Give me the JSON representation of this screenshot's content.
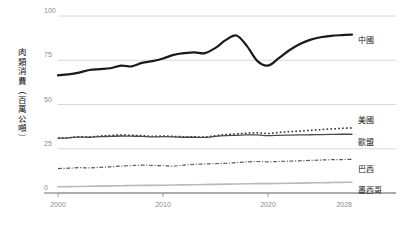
{
  "chart_data": {
    "type": "line",
    "title": "",
    "xlabel": "",
    "ylabel": "肉類消費（百萬公噸）",
    "xlim": [
      2000,
      2028
    ],
    "ylim": [
      0,
      100
    ],
    "yticks": [
      0,
      25,
      50,
      75,
      100
    ],
    "ytick_labels": [
      "0",
      "25",
      "50",
      "75",
      "100"
    ],
    "xticks": [
      2000,
      2010,
      2020,
      2028
    ],
    "xtick_labels": [
      "2000",
      "2010",
      "2020",
      "2028"
    ],
    "grid": true,
    "legend_position": "right-inline",
    "x": [
      2000,
      2001,
      2002,
      2003,
      2004,
      2005,
      2006,
      2007,
      2008,
      2009,
      2010,
      2011,
      2012,
      2013,
      2014,
      2015,
      2016,
      2017,
      2018,
      2019,
      2020,
      2021,
      2022,
      2023,
      2024,
      2025,
      2026,
      2027,
      2028
    ],
    "series": [
      {
        "name": "中國",
        "label": "中國",
        "color": "#1a1a1a",
        "style": "solid",
        "width": 2.2,
        "values": [
          66.5,
          67.0,
          68.0,
          69.5,
          70.0,
          70.5,
          72.0,
          71.5,
          73.5,
          74.5,
          76.0,
          78.0,
          79.0,
          79.5,
          79.0,
          82.0,
          86.5,
          89.0,
          83.0,
          74.5,
          72.0,
          76.0,
          80.5,
          84.0,
          86.5,
          88.0,
          88.8,
          89.2,
          89.5
        ]
      },
      {
        "name": "美國",
        "label": "美國",
        "color": "#2b2b2b",
        "style": "dotted",
        "width": 1.5,
        "values": [
          31.0,
          31.2,
          31.8,
          31.6,
          32.2,
          32.5,
          32.8,
          32.6,
          32.4,
          32.0,
          32.2,
          32.0,
          31.8,
          31.8,
          31.6,
          32.4,
          33.0,
          33.4,
          33.8,
          34.0,
          33.6,
          34.2,
          34.6,
          35.0,
          35.4,
          35.8,
          36.2,
          36.5,
          36.8
        ]
      },
      {
        "name": "歐盟",
        "label": "歐盟",
        "color": "#4a4a4a",
        "style": "solid",
        "width": 1.3,
        "values": [
          31.0,
          31.2,
          31.6,
          31.5,
          31.8,
          32.0,
          32.2,
          32.1,
          32.0,
          31.7,
          31.8,
          31.7,
          31.5,
          31.5,
          31.4,
          32.0,
          32.4,
          32.6,
          32.8,
          32.8,
          32.4,
          32.6,
          32.7,
          32.8,
          32.9,
          33.0,
          33.1,
          33.2,
          33.2
        ]
      },
      {
        "name": "巴西",
        "label": "巴西",
        "color": "#5a5a5a",
        "style": "dashdot",
        "width": 1.2,
        "values": [
          13.8,
          14.0,
          14.3,
          14.2,
          14.5,
          14.8,
          15.2,
          15.5,
          15.8,
          15.6,
          15.4,
          15.2,
          15.8,
          16.2,
          16.4,
          16.6,
          16.8,
          17.2,
          17.6,
          17.8,
          17.6,
          17.8,
          18.0,
          18.2,
          18.4,
          18.6,
          18.8,
          18.9,
          19.0
        ]
      },
      {
        "name": "墨西哥",
        "label": "墨西哥",
        "color": "#b9b9b9",
        "style": "solid",
        "width": 1.6,
        "values": [
          3.5,
          3.6,
          3.7,
          3.8,
          3.9,
          4.0,
          4.1,
          4.2,
          4.3,
          4.3,
          4.4,
          4.5,
          4.6,
          4.7,
          4.8,
          4.9,
          5.0,
          5.1,
          5.2,
          5.3,
          5.3,
          5.4,
          5.5,
          5.6,
          5.7,
          5.8,
          5.9,
          6.0,
          6.1
        ]
      }
    ]
  }
}
